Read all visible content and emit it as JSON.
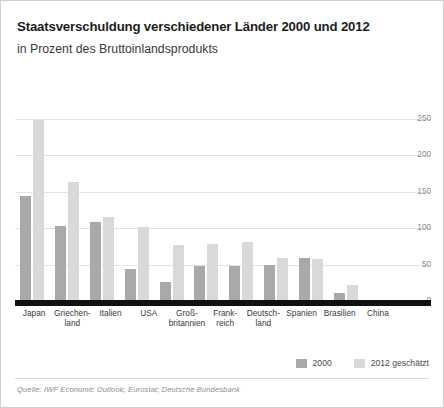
{
  "header": {
    "title": "Staatsverschuldung verschiedener Länder 2000 und 2012",
    "subtitle": "in Prozent des Bruttoinlandsprodukts"
  },
  "legend": {
    "items": [
      {
        "label": "2000",
        "color": "#a9a9a9"
      },
      {
        "label": "2012 geschätzt",
        "color": "#d9d9d9"
      }
    ]
  },
  "footer": {
    "source": "Quelle: IWF Economic Outlook; Eurostat; Deutsche Bundesbank"
  },
  "axis": {
    "yticks": [
      "250",
      "200",
      "150",
      "100",
      "50",
      "0"
    ]
  },
  "xlabels": [
    {
      "line1": "Japan",
      "line2": ""
    },
    {
      "line1": "Griechen-",
      "line2": "land"
    },
    {
      "line1": "Italien",
      "line2": ""
    },
    {
      "line1": "USA",
      "line2": ""
    },
    {
      "line1": "Groß-",
      "line2": "britannien"
    },
    {
      "line1": "Frank-",
      "line2": "reich"
    },
    {
      "line1": "Deutsch-",
      "line2": "land"
    },
    {
      "line1": "Spanien",
      "line2": ""
    },
    {
      "line1": "Brasilien",
      "line2": ""
    },
    {
      "line1": "China",
      "line2": ""
    }
  ],
  "chart_data": {
    "type": "bar",
    "title": "Staatsverschuldung verschiedener Länder 2000 und 2012",
    "subtitle": "in Prozent des Bruttoinlandsprodukts",
    "xlabel": "",
    "ylabel": "in Prozent des Bruttoinlandsprodukts",
    "ylim": [
      0,
      250
    ],
    "yticks": [
      0,
      50,
      100,
      150,
      200,
      250
    ],
    "grid": true,
    "legend_position": "bottom-right",
    "categories": [
      "Japan",
      "Griechenland",
      "Italien",
      "USA",
      "Großbritannien",
      "Frankreich",
      "Deutschland",
      "Spanien",
      "Brasilien",
      "China"
    ],
    "series": [
      {
        "name": "2000",
        "color": "#a9a9a9",
        "values": [
          144,
          103,
          109,
          44,
          26,
          48,
          48,
          50,
          59,
          11
        ]
      },
      {
        "name": "2012 geschätzt",
        "color": "#d9d9d9",
        "values": [
          248,
          163,
          115,
          101,
          77,
          78,
          81,
          59,
          58,
          22
        ]
      }
    ]
  }
}
